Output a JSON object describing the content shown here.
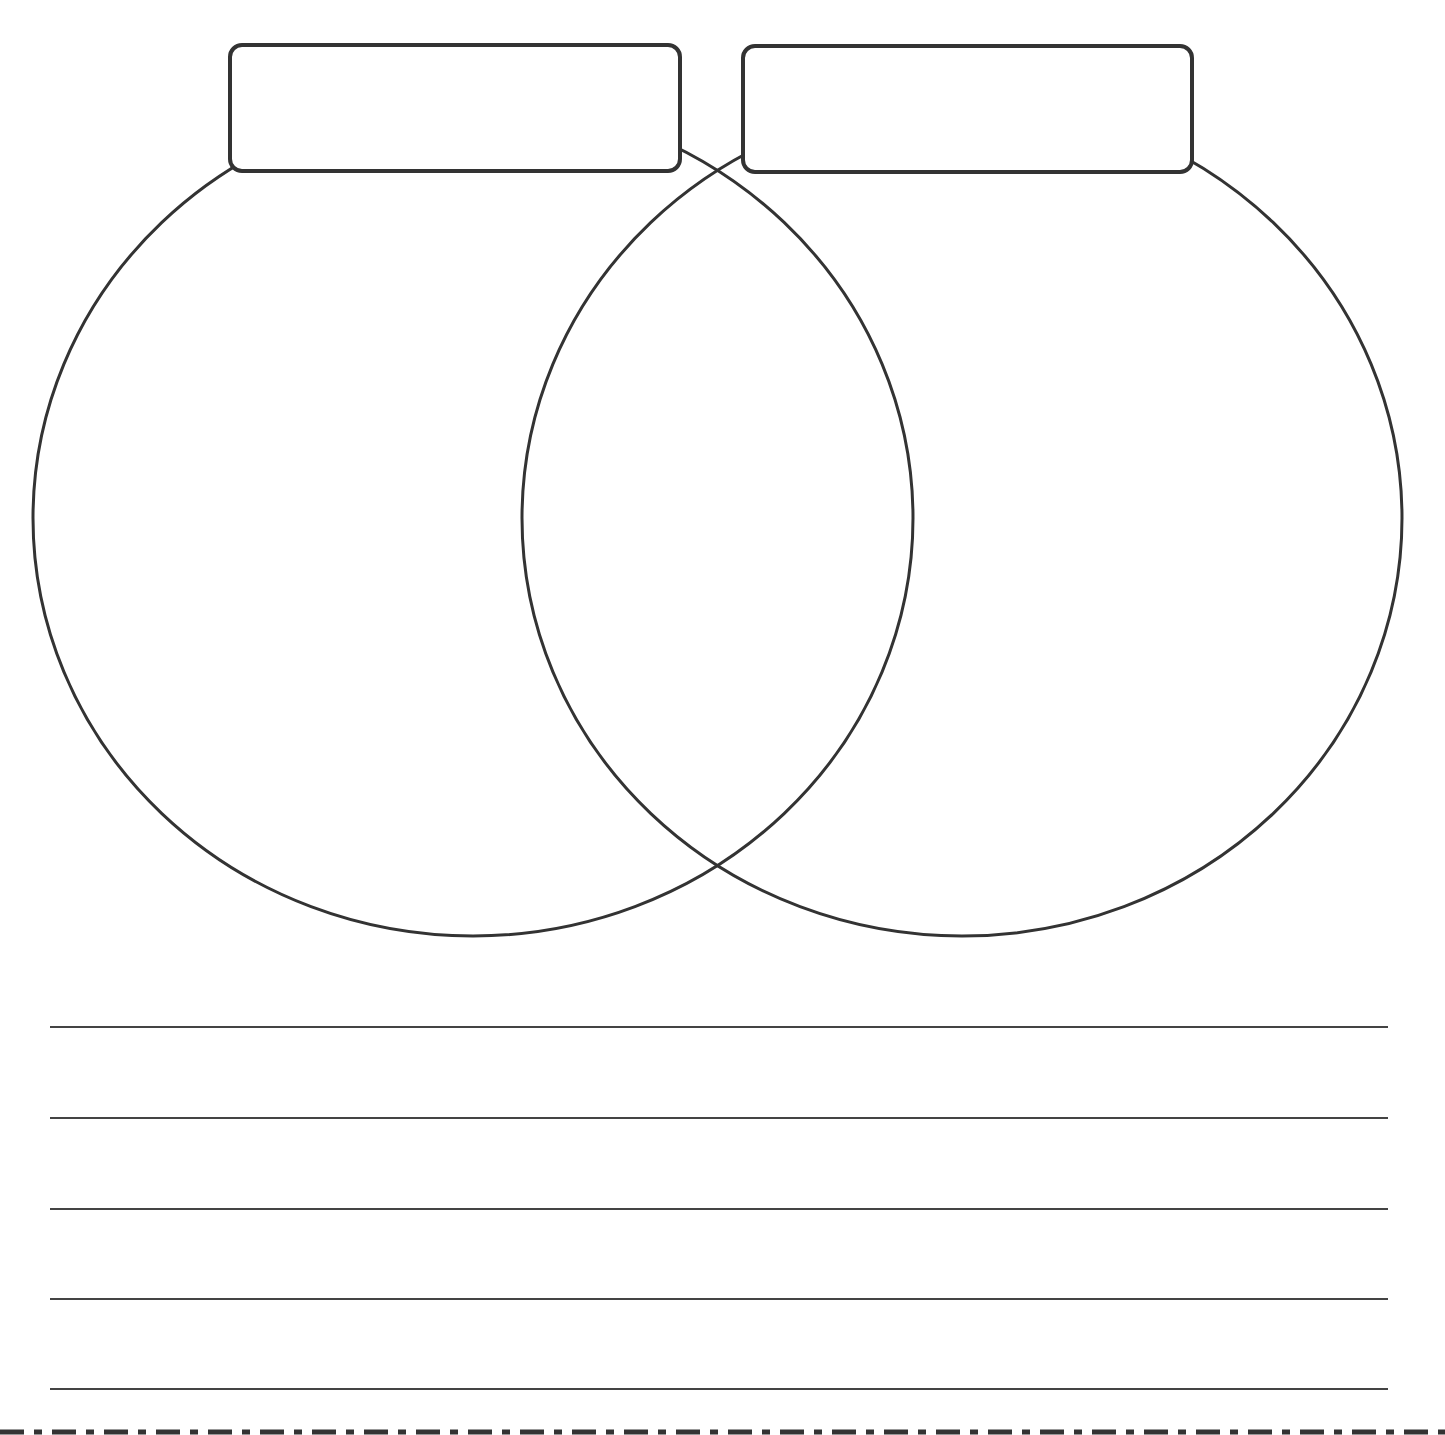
{
  "worksheet": {
    "type": "venn-diagram",
    "stroke_color": "#333333",
    "background": "#ffffff",
    "labels": [
      {
        "id": "left",
        "text": ""
      },
      {
        "id": "right",
        "text": ""
      }
    ],
    "circles": [
      {
        "id": "left",
        "cx": 473,
        "cy": 518,
        "rx": 440,
        "ry": 418
      },
      {
        "id": "right",
        "cx": 962,
        "cy": 518,
        "rx": 440,
        "ry": 418
      }
    ],
    "writing_lines": [
      {
        "y": 1027,
        "text": ""
      },
      {
        "y": 1118,
        "text": ""
      },
      {
        "y": 1209,
        "text": ""
      },
      {
        "y": 1299,
        "text": ""
      },
      {
        "y": 1389,
        "text": ""
      }
    ],
    "cut_line": {
      "style": "dash-dot"
    }
  }
}
